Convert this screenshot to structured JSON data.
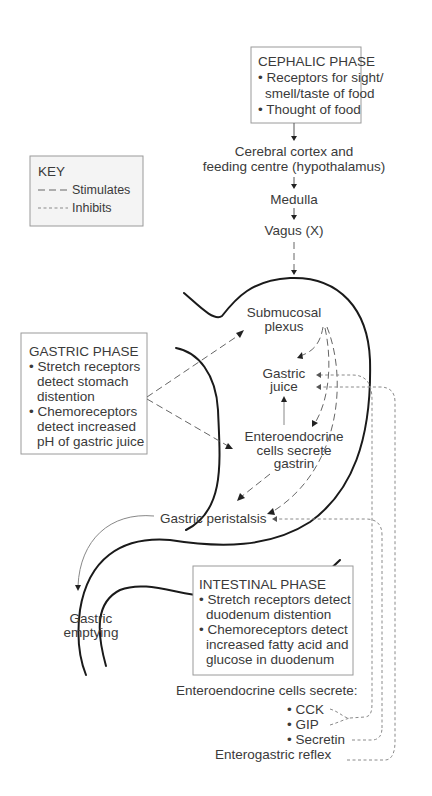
{
  "key": {
    "title": "KEY",
    "stimulates": "Stimulates",
    "inhibits": "Inhibits"
  },
  "cephalic_phase": {
    "title": "CEPHALIC PHASE",
    "lines": [
      "• Receptors for sight/",
      "smell/taste of food",
      "• Thought of food"
    ]
  },
  "pathway": {
    "cortex_line1": "Cerebral cortex and",
    "cortex_line2": "feeding centre (hypothalamus)",
    "medulla": "Medulla",
    "vagus": "Vagus (X)"
  },
  "gastric_phase": {
    "title": "GASTRIC  PHASE",
    "lines": [
      "• Stretch receptors",
      "detect stomach",
      "distention",
      "• Chemoreceptors",
      "detect increased",
      "pH of gastric juice"
    ]
  },
  "stomach_labels": {
    "submucosal_1": "Submucosal",
    "submucosal_2": "plexus",
    "gastric_juice_1": "Gastric",
    "gastric_juice_2": "juice",
    "entero_1": "Enteroendocrine",
    "entero_2": "cells secrete",
    "entero_3": "gastrin",
    "peristalsis": "Gastric peristalsis",
    "emptying_1": "Gastric",
    "emptying_2": "emptying"
  },
  "intestinal_phase": {
    "title": "INTESTINAL PHASE",
    "lines": [
      "• Stretch receptors detect",
      "duodenum distention",
      "• Chemoreceptors detect",
      "increased fatty acid and",
      "glucose in duodenum"
    ]
  },
  "secretions": {
    "heading": "Enteroendocrine cells secrete:",
    "items": [
      "• CCK",
      "• GIP",
      "• Secretin"
    ],
    "reflex": "Enterogastric reflex"
  }
}
